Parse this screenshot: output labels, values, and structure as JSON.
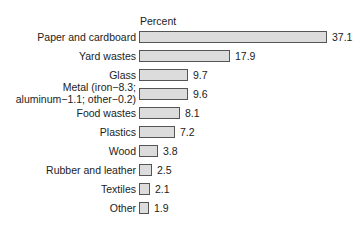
{
  "chart_data": {
    "type": "bar",
    "orientation": "horizontal",
    "title": "",
    "xlabel": "Percent",
    "ylabel": "",
    "grid": false,
    "categories": [
      "Paper and cardboard",
      "Yard wastes",
      "Glass",
      "Metal (iron−8.3; aluminum−1.1; other−0.2)",
      "Food wastes",
      "Plastics",
      "Wood",
      "Rubber and leather",
      "Textiles",
      "Other"
    ],
    "values": [
      37.1,
      17.9,
      9.7,
      9.6,
      8.1,
      7.2,
      3.8,
      2.5,
      2.1,
      1.9
    ],
    "value_labels": [
      "37.1",
      "17.9",
      "9.7",
      "9.6",
      "8.1",
      "7.2",
      "3.8",
      "2.5",
      "2.1",
      "1.9"
    ],
    "xlim": [
      0,
      37.1
    ]
  },
  "unit_label": "Percent",
  "rows": [
    {
      "line1": "Paper and cardboard",
      "line2": "",
      "value": "37.1"
    },
    {
      "line1": "Yard wastes",
      "line2": "",
      "value": "17.9"
    },
    {
      "line1": "Glass",
      "line2": "",
      "value": "9.7"
    },
    {
      "line1": "Metal (iron−8.3;",
      "line2": "aluminum−1.1; other−0.2)",
      "value": "9.6"
    },
    {
      "line1": "Food wastes",
      "line2": "",
      "value": "8.1"
    },
    {
      "line1": "Plastics",
      "line2": "",
      "value": "7.2"
    },
    {
      "line1": "Wood",
      "line2": "",
      "value": "3.8"
    },
    {
      "line1": "Rubber and leather",
      "line2": "",
      "value": "2.5"
    },
    {
      "line1": "Textiles",
      "line2": "",
      "value": "2.1"
    },
    {
      "line1": "Other",
      "line2": "",
      "value": "1.9"
    }
  ]
}
